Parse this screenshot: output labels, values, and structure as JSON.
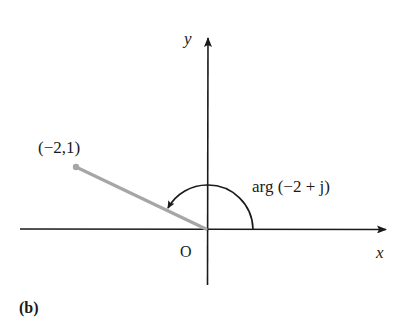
{
  "figure": {
    "panel_label": "(b)",
    "axes": {
      "x_label": "x",
      "y_label": "y",
      "origin_label": "O"
    },
    "point": {
      "label": "(−2,1)",
      "x": -2,
      "y": 1
    },
    "angle": {
      "label": "arg (−2 + j)",
      "direction": "counter-clockwise from positive x-axis"
    },
    "colors": {
      "axes": "#1a1a1a",
      "vector": "#a6a6a6",
      "arc": "#1a1a1a",
      "background": "#ffffff"
    }
  }
}
